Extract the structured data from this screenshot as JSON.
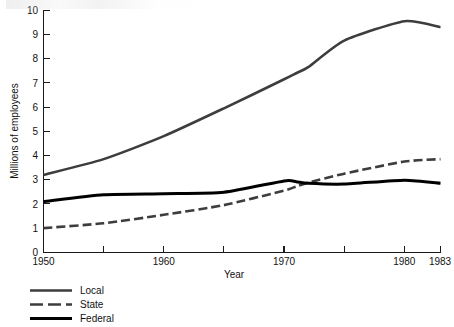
{
  "chart_data": {
    "type": "line",
    "title": "",
    "xlabel": "Year",
    "ylabel": "Millions of employees",
    "xlim": [
      1950,
      1983
    ],
    "ylim": [
      0,
      10
    ],
    "ytick_step": 1,
    "yticks": [
      "0",
      "1",
      "2",
      "3",
      "4",
      "5",
      "6",
      "7",
      "8",
      "9",
      "10"
    ],
    "xticks_major": [
      "1950",
      "1960",
      "1970",
      "1980",
      "1983"
    ],
    "xticks_minor": [
      "1955",
      "1965",
      "1975"
    ],
    "grid": false,
    "legend_position": "below-left",
    "x": [
      1950,
      1955,
      1960,
      1965,
      1970,
      1971,
      1972,
      1975,
      1980,
      1983
    ],
    "series": [
      {
        "name": "Local",
        "style": "solid",
        "color": "#3d3d3d",
        "width": 2.6,
        "values": [
          3.2,
          3.85,
          4.8,
          5.95,
          7.15,
          7.4,
          7.65,
          8.75,
          9.55,
          9.3
        ]
      },
      {
        "name": "State",
        "style": "dashed",
        "color": "#3d3d3d",
        "width": 2.6,
        "values": [
          1.0,
          1.2,
          1.55,
          1.95,
          2.55,
          2.72,
          2.88,
          3.25,
          3.75,
          3.85
        ]
      },
      {
        "name": "Federal",
        "style": "solid",
        "color": "#000000",
        "width": 3.0,
        "values": [
          2.1,
          2.38,
          2.42,
          2.48,
          2.95,
          2.92,
          2.85,
          2.82,
          2.98,
          2.85
        ]
      }
    ]
  },
  "axes": {
    "y_title": "Millions of employees",
    "x_title": "Year",
    "y_tick_labels": [
      "10",
      "9",
      "8",
      "7",
      "6",
      "5",
      "4",
      "3",
      "2",
      "1",
      "0"
    ],
    "x_tick_labels": [
      "1950",
      "1960",
      "1970",
      "1980",
      "1983"
    ]
  },
  "legend": {
    "items": [
      {
        "label": "Local"
      },
      {
        "label": "State"
      },
      {
        "label": "Federal"
      }
    ]
  }
}
